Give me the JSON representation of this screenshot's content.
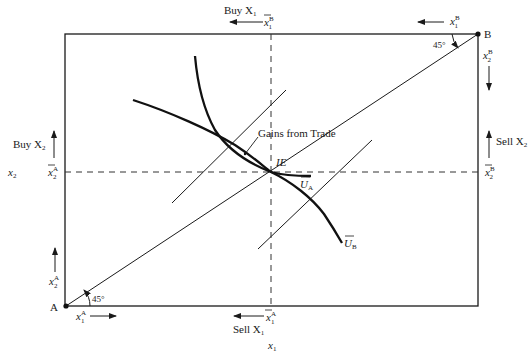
{
  "diagram": {
    "type": "edgeworth-box",
    "origins": {
      "A": "A",
      "B": "B"
    },
    "angle_label_A": "45°",
    "angle_label_B": "45°",
    "top": {
      "direction_label": "Buy X",
      "direction_sub": "1",
      "endowment_label": "x̄",
      "endowment_sub": "1",
      "endowment_sup": "B",
      "axis_label": "x",
      "axis_sub": "1",
      "axis_sup": "B"
    },
    "bottom": {
      "direction_label": "Sell X",
      "direction_sub": "1",
      "endowment_label": "x̄",
      "endowment_sub": "1",
      "endowment_sup": "A",
      "axis_label": "x",
      "axis_sub": "1",
      "axis_sup": "A",
      "variable": "x",
      "variable_sub": "1"
    },
    "left": {
      "direction_label": "Buy X",
      "direction_sub": "2",
      "endowment_label": "x̄",
      "endowment_sub": "2",
      "endowment_sup": "A",
      "axis_label": "x",
      "axis_sub": "2",
      "axis_sup": "A",
      "variable": "x",
      "variable_sub": "2"
    },
    "right": {
      "direction_label": "Sell X",
      "direction_sub": "2",
      "endowment_label": "x̄",
      "endowment_sub": "2",
      "endowment_sup": "B",
      "axis_label": "x",
      "axis_sub": "2",
      "axis_sup": "B"
    },
    "center": {
      "initial_endowment": "IE",
      "gains_label": "Gains from Trade",
      "curve_A": "U",
      "curve_A_sub": "A",
      "curve_B": "U",
      "curve_B_sub": "B"
    }
  }
}
